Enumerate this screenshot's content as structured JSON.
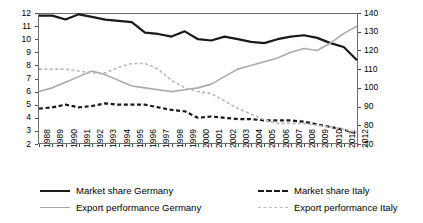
{
  "chart_data": {
    "type": "line",
    "title": "",
    "xlabel": "",
    "ylabel": "",
    "y2label": "",
    "grid": false,
    "legend_position": "bottom",
    "x": [
      1988,
      1989,
      1990,
      1991,
      1992,
      1993,
      1994,
      1995,
      1996,
      1997,
      1998,
      1999,
      2000,
      2001,
      2002,
      2003,
      2004,
      2005,
      2006,
      2007,
      2008,
      2009,
      2010,
      2011,
      2012
    ],
    "xtick_labels": [
      "1988",
      "1989",
      "1990",
      "1991",
      "1992",
      "1993",
      "1994",
      "1995",
      "1996",
      "1997",
      "1998",
      "1999",
      "2000",
      "2001",
      "2002",
      "2003",
      "2004",
      "2005",
      "2006",
      "2007",
      "2008",
      "2009",
      "2010",
      "2011",
      "2012"
    ],
    "ylim": [
      2,
      12
    ],
    "yticks": [
      2,
      3,
      4,
      5,
      6,
      7,
      8,
      9,
      10,
      11,
      12
    ],
    "ytick_labels": [
      "2",
      "3",
      "4",
      "5",
      "6",
      "7",
      "8",
      "9",
      "10",
      "11",
      "12"
    ],
    "y2lim": [
      70,
      140
    ],
    "y2ticks": [
      70,
      80,
      90,
      100,
      110,
      120,
      130,
      140
    ],
    "y2tick_labels": [
      "70",
      "80",
      "90",
      "100",
      "110",
      "120",
      "130",
      "140"
    ],
    "series": [
      {
        "name": "Market share Germany",
        "axis": "left",
        "style": "solid",
        "color": "#1a1a1a",
        "width": 2.2,
        "values": [
          11.8,
          11.8,
          11.5,
          11.9,
          11.7,
          11.5,
          11.4,
          11.3,
          10.5,
          10.4,
          10.2,
          10.6,
          10.0,
          9.9,
          10.2,
          10.0,
          9.8,
          9.7,
          10.0,
          10.2,
          10.3,
          10.1,
          9.7,
          9.4,
          8.4
        ]
      },
      {
        "name": "Market share Italy",
        "axis": "left",
        "style": "dashed",
        "color": "#1a1a1a",
        "width": 2.2,
        "values": [
          4.7,
          4.8,
          5.0,
          4.8,
          4.9,
          5.1,
          5.0,
          5.0,
          5.0,
          4.8,
          4.6,
          4.5,
          4.0,
          4.1,
          4.0,
          3.9,
          3.9,
          3.8,
          3.8,
          3.8,
          3.7,
          3.5,
          3.3,
          3.1,
          2.8
        ]
      },
      {
        "name": "Export performance Germany",
        "axis": "right",
        "style": "solid",
        "color": "#aaaaaa",
        "width": 1.6,
        "values": [
          98,
          100,
          103,
          106,
          109,
          107,
          104,
          101,
          100,
          99,
          98,
          99,
          100,
          102,
          106,
          110,
          112,
          114,
          116,
          119,
          121,
          120,
          124,
          129,
          133
        ]
      },
      {
        "name": "Export performance Italy",
        "axis": "right",
        "style": "dashed",
        "color": "#b9b9b9",
        "width": 1.6,
        "values": [
          110,
          110,
          110,
          109,
          108,
          108,
          111,
          113,
          113,
          110,
          104,
          100,
          98,
          97,
          93,
          89,
          86,
          83,
          81,
          81,
          81,
          80,
          79,
          78,
          76
        ]
      }
    ]
  },
  "legend": {
    "entries": [
      {
        "label": "Market share Germany",
        "swatch": "sw-solid-dark"
      },
      {
        "label": "Market share Italy",
        "swatch": "sw-dash-dark"
      },
      {
        "label": "Export performance Germany",
        "swatch": "sw-solid-grey"
      },
      {
        "label": "Export performance Italy",
        "swatch": "sw-dash-grey"
      }
    ]
  }
}
